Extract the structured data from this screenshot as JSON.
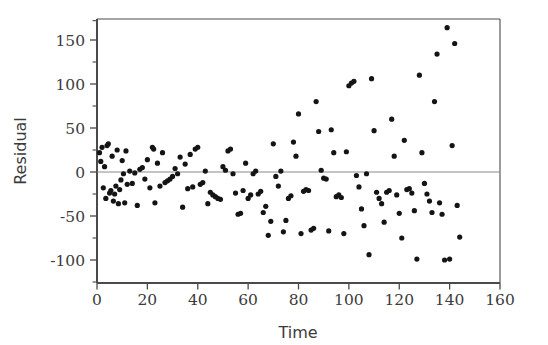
{
  "chart_data": {
    "type": "scatter",
    "title": "",
    "subtitle": "",
    "xlabel": "Time",
    "ylabel": "Residual",
    "xlim": [
      0,
      160
    ],
    "ylim": [
      -120,
      172
    ],
    "xticks": [
      0,
      20,
      40,
      60,
      80,
      100,
      120,
      140,
      160
    ],
    "xtick_labels": [
      "0",
      "20",
      "40",
      "60",
      "80",
      "100",
      "120",
      "140",
      "160"
    ],
    "yticks": [
      -100,
      -50,
      0,
      50,
      100,
      150
    ],
    "ytick_labels": [
      "-100",
      "-50",
      "0",
      "50",
      "100",
      "150"
    ],
    "grid": false,
    "legend": null,
    "annotations": [],
    "reference_lines": [
      {
        "orientation": "horizontal",
        "value": 0,
        "color": "#8a8a8a"
      }
    ],
    "marker": {
      "shape": "circle",
      "color": "#141414",
      "size": 2.6
    },
    "series": [
      {
        "name": "Residual",
        "points": [
          [
            1,
            22
          ],
          [
            1.5,
            12
          ],
          [
            2,
            28
          ],
          [
            2.5,
            -18
          ],
          [
            3,
            6
          ],
          [
            3.5,
            -30
          ],
          [
            4,
            30
          ],
          [
            4.5,
            32
          ],
          [
            5,
            -24
          ],
          [
            5.5,
            -21
          ],
          [
            6,
            18
          ],
          [
            6.5,
            -33
          ],
          [
            7,
            -25
          ],
          [
            7.5,
            -16
          ],
          [
            8,
            25
          ],
          [
            8.5,
            -36
          ],
          [
            9,
            -20
          ],
          [
            9.5,
            -9
          ],
          [
            10,
            13
          ],
          [
            10.5,
            -2
          ],
          [
            11,
            -35
          ],
          [
            11.5,
            24
          ],
          [
            12,
            -14
          ],
          [
            13,
            1
          ],
          [
            14,
            -13
          ],
          [
            15,
            -1
          ],
          [
            16,
            -38
          ],
          [
            17,
            3
          ],
          [
            18,
            5
          ],
          [
            19,
            -8
          ],
          [
            20,
            14
          ],
          [
            21,
            -18
          ],
          [
            22,
            28
          ],
          [
            22.5,
            26
          ],
          [
            23,
            -35
          ],
          [
            24,
            10
          ],
          [
            25,
            -16
          ],
          [
            26,
            22
          ],
          [
            27,
            -12
          ],
          [
            28,
            -10
          ],
          [
            29,
            -8
          ],
          [
            30,
            -5
          ],
          [
            31,
            4
          ],
          [
            32,
            -2
          ],
          [
            33,
            17
          ],
          [
            34,
            -40
          ],
          [
            35,
            9
          ],
          [
            36,
            -19
          ],
          [
            37,
            20
          ],
          [
            38,
            -17
          ],
          [
            39,
            26
          ],
          [
            40,
            28
          ],
          [
            41,
            -14
          ],
          [
            42,
            -12
          ],
          [
            43,
            1
          ],
          [
            44,
            -36
          ],
          [
            45,
            -23
          ],
          [
            46,
            -26
          ],
          [
            47,
            -28
          ],
          [
            48,
            -30
          ],
          [
            49,
            -31
          ],
          [
            50,
            6
          ],
          [
            51,
            2
          ],
          [
            52,
            24
          ],
          [
            53,
            26
          ],
          [
            54,
            -2
          ],
          [
            55,
            -24
          ],
          [
            56,
            -48
          ],
          [
            57,
            -47
          ],
          [
            58,
            -21
          ],
          [
            59,
            10
          ],
          [
            60,
            -30
          ],
          [
            61,
            -26
          ],
          [
            62,
            -2
          ],
          [
            63,
            1
          ],
          [
            64,
            -25
          ],
          [
            65,
            -22
          ],
          [
            66,
            -46
          ],
          [
            67,
            -39
          ],
          [
            68,
            -72
          ],
          [
            69,
            -56
          ],
          [
            70,
            32
          ],
          [
            71,
            -5
          ],
          [
            72,
            -16
          ],
          [
            73,
            1
          ],
          [
            74,
            -68
          ],
          [
            75,
            -55
          ],
          [
            76,
            -30
          ],
          [
            77,
            -27
          ],
          [
            78,
            34
          ],
          [
            79,
            18
          ],
          [
            80,
            66
          ],
          [
            81,
            -70
          ],
          [
            82,
            -22
          ],
          [
            83,
            -20
          ],
          [
            84,
            -21
          ],
          [
            85,
            -66
          ],
          [
            86,
            -64
          ],
          [
            87,
            80
          ],
          [
            88,
            46
          ],
          [
            89,
            2
          ],
          [
            90,
            -7
          ],
          [
            91,
            -8
          ],
          [
            92,
            -67
          ],
          [
            93,
            48
          ],
          [
            94,
            22
          ],
          [
            95,
            -28
          ],
          [
            96,
            -26
          ],
          [
            97,
            -29
          ],
          [
            98,
            -70
          ],
          [
            99,
            23
          ],
          [
            100,
            98
          ],
          [
            101,
            101
          ],
          [
            102,
            103
          ],
          [
            103,
            -4
          ],
          [
            104,
            -17
          ],
          [
            105,
            -42
          ],
          [
            106,
            -61
          ],
          [
            107,
            -2
          ],
          [
            108,
            -94
          ],
          [
            109,
            106
          ],
          [
            110,
            47
          ],
          [
            111,
            -23
          ],
          [
            112,
            -30
          ],
          [
            113,
            -36
          ],
          [
            114,
            -57
          ],
          [
            115,
            -23
          ],
          [
            116,
            -21
          ],
          [
            117,
            60
          ],
          [
            118,
            18
          ],
          [
            119,
            -26
          ],
          [
            120,
            -47
          ],
          [
            121,
            -75
          ],
          [
            122,
            36
          ],
          [
            123,
            -20
          ],
          [
            124,
            -19
          ],
          [
            125,
            -24
          ],
          [
            126,
            -44
          ],
          [
            127,
            -99
          ],
          [
            128,
            110
          ],
          [
            129,
            22
          ],
          [
            130,
            -13
          ],
          [
            131,
            -25
          ],
          [
            132,
            -33
          ],
          [
            133,
            -46
          ],
          [
            134,
            80
          ],
          [
            135,
            134
          ],
          [
            136,
            -35
          ],
          [
            137,
            -48
          ],
          [
            138,
            -100
          ],
          [
            139,
            164
          ],
          [
            140,
            -99
          ],
          [
            141,
            30
          ],
          [
            142,
            146
          ],
          [
            143,
            -38
          ],
          [
            144,
            -74
          ]
        ]
      }
    ]
  },
  "axes": {
    "x_title": "Time",
    "y_title": "Residual"
  }
}
